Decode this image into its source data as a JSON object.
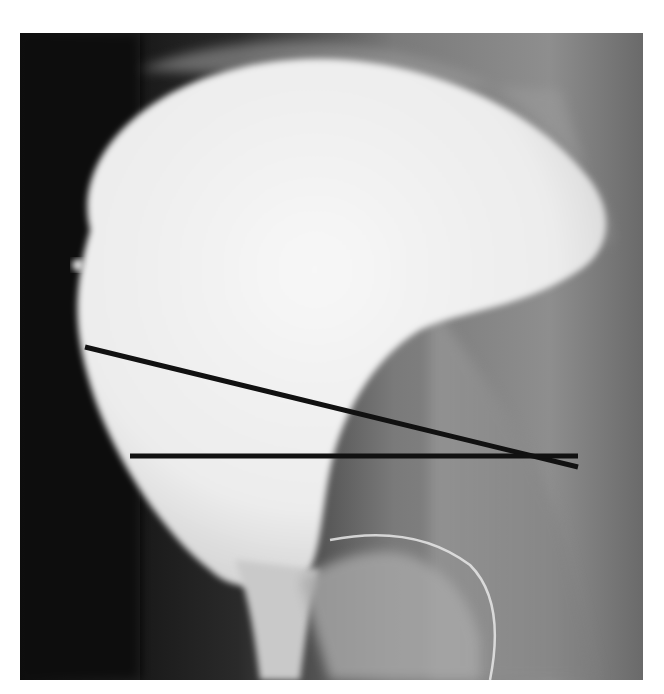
{
  "figure": {
    "frame": {
      "x": 20,
      "y": 33,
      "width": 623,
      "height": 647
    },
    "lines": [
      {
        "name": "oblique-line",
        "x1": 85,
        "y1": 347,
        "x2": 578,
        "y2": 467,
        "color": "#111111"
      },
      {
        "name": "horizontal-line",
        "x1": 130,
        "y1": 456,
        "x2": 578,
        "y2": 456,
        "color": "#111111"
      }
    ],
    "colors": {
      "background": "#ffffff",
      "dark_soft_tissue": "#0d0d0d",
      "contrast_fill": "#f4f4f4",
      "mid_tissue": "#8a8a8a",
      "line": "#111111"
    }
  }
}
